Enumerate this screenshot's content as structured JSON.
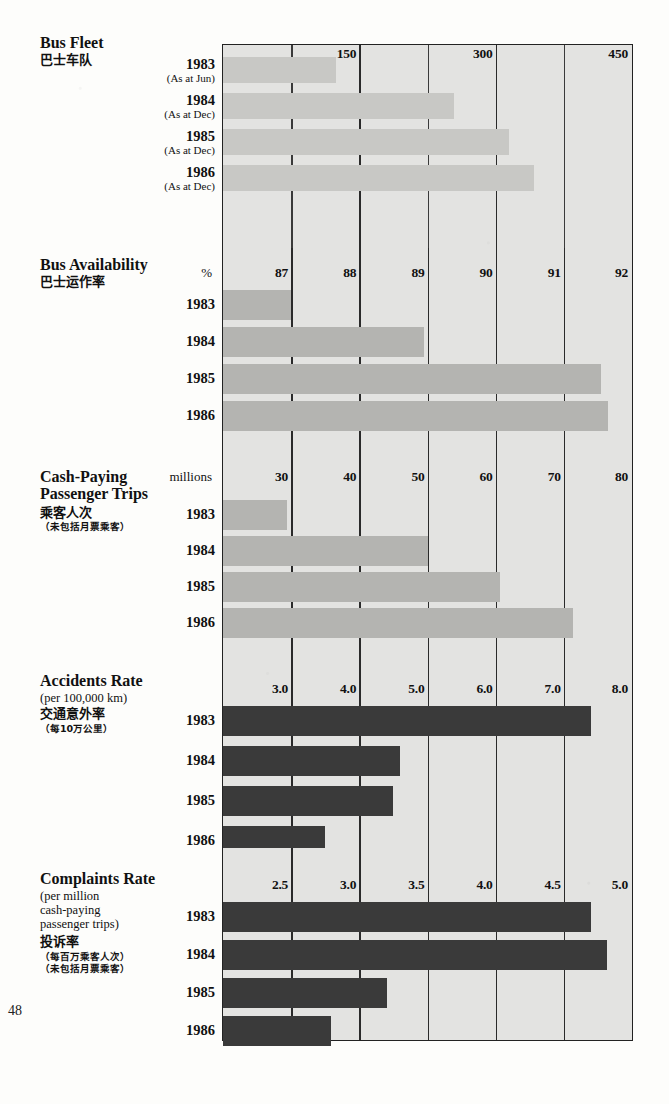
{
  "page": {
    "page_number": "48",
    "background_color": "#fdfdfb",
    "plot_fill_color": "#e3e3e1",
    "bar_color_light": "#c8c8c5",
    "bar_color_mid": "#b4b4b1",
    "bar_color_dark": "#3a3a3a"
  },
  "chart_data": [
    {
      "type": "bar",
      "orientation": "horizontal",
      "title": "Bus Fleet",
      "title_cn": "巴士车队",
      "unit": "",
      "categories": [
        "1983",
        "1984",
        "1985",
        "1986"
      ],
      "category_notes": [
        "(As at Jun)",
        "(As at Dec)",
        "(As at Dec)",
        "(As at Dec)"
      ],
      "values": [
        124,
        254,
        315,
        342
      ],
      "xlim": [
        0,
        450
      ],
      "ticks": [
        150,
        300,
        450
      ],
      "tick_labels": [
        "150",
        "300",
        "450"
      ],
      "minor_ticks": [
        75,
        225,
        375
      ],
      "grid": true,
      "bar_shade": "light"
    },
    {
      "type": "bar",
      "orientation": "horizontal",
      "title": "Bus Availability",
      "title_cn": "巴士运作率",
      "unit": "%",
      "categories": [
        "1983",
        "1984",
        "1985",
        "1986"
      ],
      "category_notes": [
        "",
        "",
        "",
        ""
      ],
      "values": [
        87.0,
        88.95,
        91.55,
        91.65
      ],
      "xlim": [
        86,
        92
      ],
      "ticks": [
        87,
        88,
        89,
        90,
        91,
        92
      ],
      "tick_labels": [
        "87",
        "88",
        "89",
        "90",
        "91",
        "92"
      ],
      "minor_ticks": [],
      "grid": true,
      "bar_shade": "mid"
    },
    {
      "type": "bar",
      "orientation": "horizontal",
      "title": "Cash-Paying\nPassenger Trips",
      "title_cn": "乘客人次",
      "title_cn_sub": "（未包括月票乘客）",
      "unit": "millions",
      "categories": [
        "1983",
        "1984",
        "1985",
        "1986"
      ],
      "category_notes": [
        "",
        "",
        "",
        ""
      ],
      "values": [
        29.4,
        50.1,
        60.7,
        71.3
      ],
      "xlim": [
        20,
        80
      ],
      "ticks": [
        30,
        40,
        50,
        60,
        70,
        80
      ],
      "tick_labels": [
        "30",
        "40",
        "50",
        "60",
        "70",
        "80"
      ],
      "minor_ticks": [],
      "grid": true,
      "bar_shade": "mid"
    },
    {
      "type": "bar",
      "orientation": "horizontal",
      "title": "Accidents Rate",
      "title_sub": "(per 100,000 km)",
      "title_cn": "交通意外率",
      "title_cn_sub": "（每10万公里）",
      "unit": "",
      "categories": [
        "1983",
        "1984",
        "1985",
        "1986"
      ],
      "category_notes": [
        "",
        "",
        "",
        ""
      ],
      "values": [
        7.4,
        4.6,
        4.5,
        3.5
      ],
      "xlim": [
        2.0,
        8.0
      ],
      "ticks": [
        3.0,
        4.0,
        5.0,
        6.0,
        7.0,
        8.0
      ],
      "tick_labels": [
        "3.0",
        "4.0",
        "5.0",
        "6.0",
        "7.0",
        "8.0"
      ],
      "minor_ticks": [],
      "grid": true,
      "bar_shade": "dark"
    },
    {
      "type": "bar",
      "orientation": "horizontal",
      "title": "Complaints Rate",
      "title_sub": "(per million\n  cash-paying\n  passenger trips)",
      "title_cn": "投诉率",
      "title_cn_sub": "（每百万乘客人次）\n（未包括月票乘客）",
      "unit": "",
      "categories": [
        "1983",
        "1984",
        "1985",
        "1986"
      ],
      "category_notes": [
        "",
        "",
        "",
        ""
      ],
      "values": [
        4.7,
        4.82,
        3.2,
        2.79
      ],
      "xlim": [
        2.0,
        5.0
      ],
      "ticks": [
        2.5,
        3.0,
        3.5,
        4.0,
        4.5,
        5.0
      ],
      "tick_labels": [
        "2.5",
        "3.0",
        "3.5",
        "4.0",
        "4.5",
        "5.0"
      ],
      "minor_ticks": [],
      "grid": true,
      "bar_shade": "dark"
    }
  ]
}
